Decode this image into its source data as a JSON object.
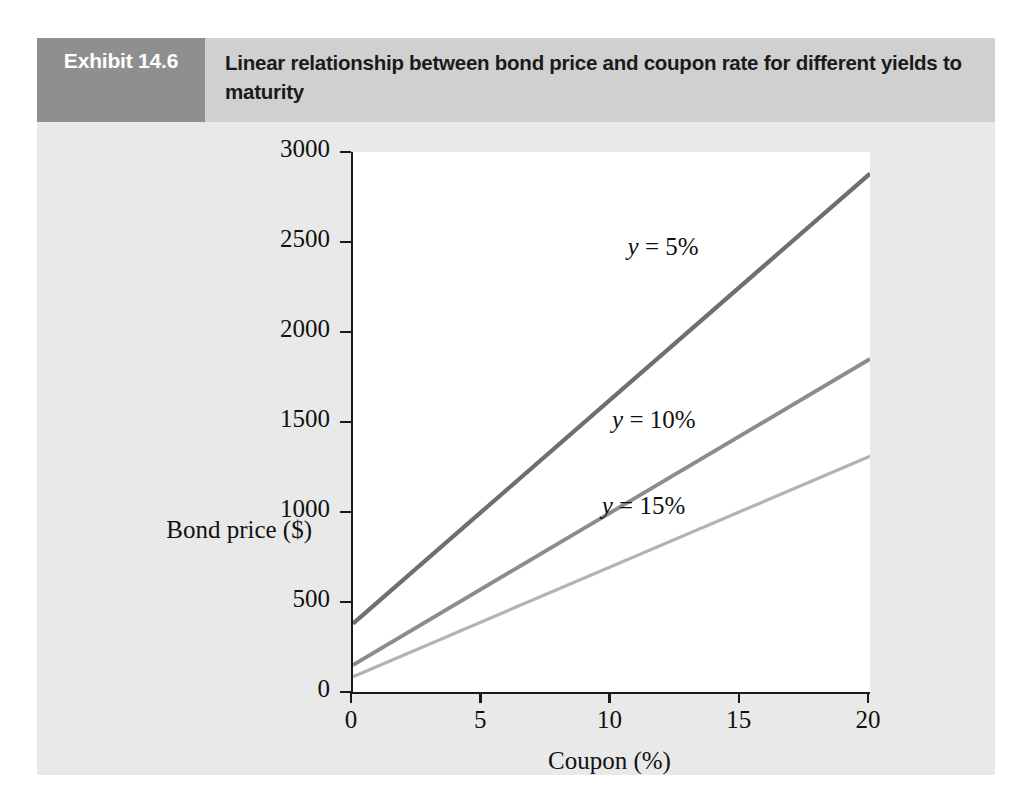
{
  "exhibit": {
    "number_label": "Exhibit 14.6",
    "title": "Linear relationship between bond price and coupon rate for different yields to maturity",
    "number_box_color": "#8f8f8f",
    "header_band_color": "#d0d0d0",
    "panel_color": "#e9e9e9"
  },
  "chart_data": {
    "type": "line",
    "title": "Linear relationship between bond price and coupon rate for different yields to maturity",
    "xlabel": "Coupon (%)",
    "ylabel": "Bond price ($)",
    "xlim": [
      0,
      20
    ],
    "ylim": [
      0,
      3000
    ],
    "xticks": [
      0,
      5,
      10,
      15,
      20
    ],
    "yticks": [
      0,
      500,
      1000,
      1500,
      2000,
      2500,
      3000
    ],
    "xtick_labels": [
      "0",
      "5",
      "10",
      "15",
      "20"
    ],
    "ytick_labels": [
      "0",
      "500",
      "1000",
      "1500",
      "2000",
      "2500",
      "3000"
    ],
    "grid": false,
    "legend": "inline-annotations",
    "x": [
      0,
      20
    ],
    "series": [
      {
        "name": "y = 5%",
        "label_html": "<i>y</i> = 5%",
        "values": [
          380,
          2880
        ],
        "color": "#6f6f6f",
        "width": 4.2,
        "label_x": 10.7,
        "label_y": 2460
      },
      {
        "name": "y = 10%",
        "label_html": "<i>y</i> = 10%",
        "values": [
          150,
          1850
        ],
        "color": "#8c8c8c",
        "width": 3.8,
        "label_x": 10.1,
        "label_y": 1500
      },
      {
        "name": "y = 15%",
        "label_html": "<i>y</i> = 15%",
        "values": [
          85,
          1310
        ],
        "color": "#b3b3b3",
        "width": 3.2,
        "label_x": 9.7,
        "label_y": 1020
      }
    ]
  }
}
